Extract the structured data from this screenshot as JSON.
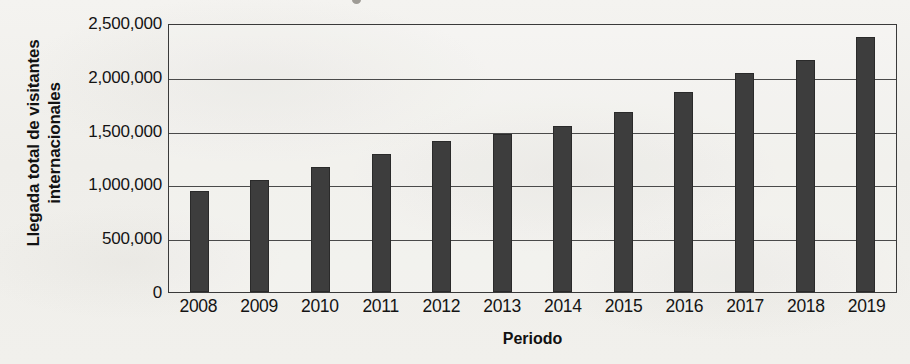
{
  "chart_data": {
    "type": "bar",
    "title": "",
    "xlabel": "Periodo",
    "ylabel": "Llegada total de visitantes internacionales",
    "ylabel_lines": [
      "Llegada total de visitantes",
      "internacionales"
    ],
    "categories": [
      "2008",
      "2009",
      "2010",
      "2011",
      "2012",
      "2013",
      "2014",
      "2015",
      "2016",
      "2017",
      "2018",
      "2019"
    ],
    "values": [
      950000,
      1045000,
      1170000,
      1290000,
      1410000,
      1480000,
      1550000,
      1690000,
      1870000,
      2055000,
      2175000,
      2385000
    ],
    "ylim": [
      0,
      2500000
    ],
    "ytick_values": [
      0,
      500000,
      1000000,
      1500000,
      2000000,
      2500000
    ],
    "ytick_labels": [
      "0",
      "500,000",
      "1,000,000",
      "1,500,000",
      "2,000,000",
      "2,500,000"
    ],
    "grid": true,
    "grid_axis": "y",
    "legend": false,
    "bar_color": "#3d3d3d",
    "axis_color": "#3a3a3a",
    "background_color": "#f2f1ee"
  }
}
